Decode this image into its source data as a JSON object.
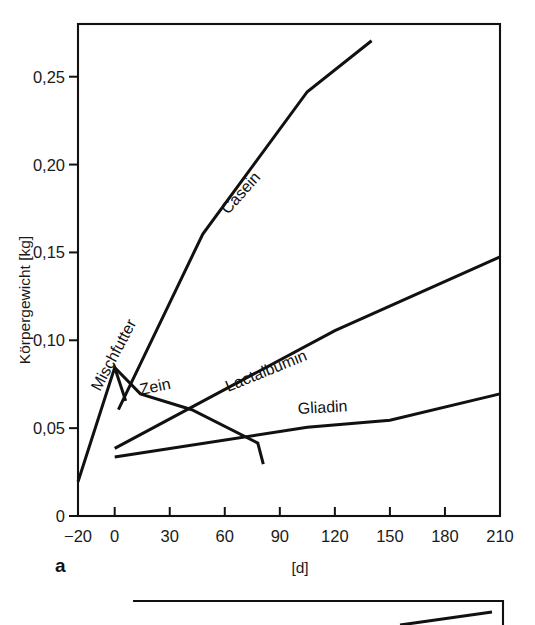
{
  "figure": {
    "panel_label": "a",
    "background": "#ffffff",
    "line_color": "#111111"
  },
  "chart_data": {
    "type": "line",
    "title": "",
    "xlabel": "[d]",
    "ylabel": "Körpergewicht [kg]",
    "xlim": [
      -20,
      210
    ],
    "ylim": [
      0,
      0.28
    ],
    "xticks": [
      -20,
      0,
      30,
      60,
      90,
      120,
      150,
      180,
      210
    ],
    "xticklabels": [
      "−20",
      "0",
      "30",
      "60",
      "90",
      "120",
      "150",
      "180",
      "210"
    ],
    "yticks": [
      0,
      0.05,
      0.1,
      0.15,
      0.2,
      0.25
    ],
    "yticklabels": [
      "0",
      "0,05",
      "0,10",
      "0,15",
      "0,20",
      "0,25"
    ],
    "grid": false,
    "legend": "inline-curve-labels",
    "series": [
      {
        "name": "Mischfutter",
        "label": "Mischfutter",
        "label_rotation": -62,
        "points": [
          {
            "x": -20,
            "y": 0.0195
          },
          {
            "x": 0,
            "y": 0.0845
          },
          {
            "x": 6,
            "y": 0.0655
          }
        ]
      },
      {
        "name": "Casein",
        "label": "Casein",
        "label_rotation": -48,
        "points": [
          {
            "x": 2,
            "y": 0.0605
          },
          {
            "x": 48,
            "y": 0.1605
          },
          {
            "x": 105,
            "y": 0.2415
          },
          {
            "x": 140,
            "y": 0.2705
          }
        ]
      },
      {
        "name": "Zein",
        "label": "Zein",
        "label_rotation": -12,
        "points": [
          {
            "x": 0,
            "y": 0.0845
          },
          {
            "x": 14,
            "y": 0.0695
          },
          {
            "x": 42,
            "y": 0.0605
          },
          {
            "x": 78,
            "y": 0.0415
          },
          {
            "x": 81,
            "y": 0.0295
          }
        ]
      },
      {
        "name": "Lactalbumin",
        "label": "Lactalbumin",
        "label_rotation": -22,
        "points": [
          {
            "x": 0,
            "y": 0.0385
          },
          {
            "x": 120,
            "y": 0.1055
          },
          {
            "x": 210,
            "y": 0.1475
          }
        ]
      },
      {
        "name": "Gliadin",
        "label": "Gliadin",
        "label_rotation": -3,
        "points": [
          {
            "x": 0,
            "y": 0.0335
          },
          {
            "x": 105,
            "y": 0.0505
          },
          {
            "x": 150,
            "y": 0.0545
          },
          {
            "x": 210,
            "y": 0.0695
          }
        ]
      }
    ]
  },
  "bottom_panel": {
    "note": "partially visible second panel frame",
    "fragment_points": [
      {
        "x": 0.72,
        "y": 0.96
      },
      {
        "x": 0.97,
        "y": 0.62
      }
    ]
  }
}
